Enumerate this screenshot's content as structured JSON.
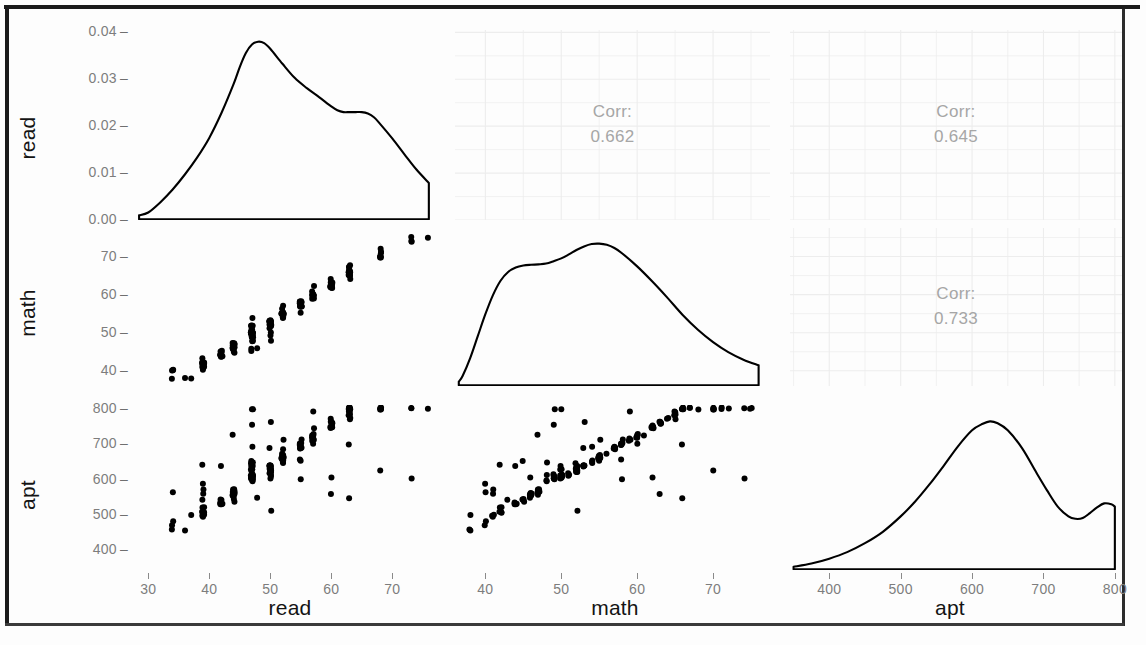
{
  "figure": {
    "type": "scatterplot-matrix",
    "variables": [
      "read",
      "math",
      "apt"
    ],
    "diagonal": "density",
    "lower": "points",
    "upper": "correlation"
  },
  "labels": {
    "read": "read",
    "math": "math",
    "apt": "apt",
    "corr_prefix": "Corr:"
  },
  "axes": {
    "read_density_y": {
      "ticks": [
        "0.04",
        "0.03",
        "0.02",
        "0.01",
        "0.00"
      ],
      "values": [
        0.04,
        0.03,
        0.02,
        0.01,
        0.0
      ]
    },
    "math_y": {
      "ticks": [
        "70",
        "60",
        "50",
        "40"
      ],
      "values": [
        70,
        60,
        50,
        40
      ]
    },
    "apt_y": {
      "ticks": [
        "800",
        "700",
        "600",
        "500",
        "400"
      ],
      "values": [
        800,
        700,
        600,
        500,
        400
      ]
    },
    "read_x": {
      "ticks": [
        "30",
        "40",
        "50",
        "60",
        "70"
      ],
      "values": [
        30,
        40,
        50,
        60,
        70
      ]
    },
    "math_x": {
      "ticks": [
        "40",
        "50",
        "60",
        "70"
      ],
      "values": [
        40,
        50,
        60,
        70
      ]
    },
    "apt_x": {
      "ticks": [
        "400",
        "500",
        "600",
        "700",
        "800"
      ],
      "values": [
        400,
        500,
        600,
        700,
        800
      ]
    }
  },
  "correlations": [
    {
      "row": "read",
      "col": "math",
      "label": "Corr:",
      "value": "0.662"
    },
    {
      "row": "read",
      "col": "apt",
      "label": "Corr:",
      "value": "0.645"
    },
    {
      "row": "math",
      "col": "apt",
      "label": "Corr:",
      "value": "0.733"
    }
  ],
  "colors": {
    "point": "#000000",
    "density_line": "#000000",
    "grid": "#ededed",
    "tick_text": "#7d7d7d",
    "axis_title": "#141414",
    "corr_text": "#a6a6a6",
    "panel_bg": "#ffffff",
    "frame": "#1a1a1a"
  },
  "chart_data": {
    "type": "scatter",
    "title": "",
    "xlabel": "",
    "ylabel": "",
    "grid": true,
    "legend": "none",
    "ranges": {
      "read": [
        27.5,
        77.5
      ],
      "math": [
        36.0,
        77.5
      ],
      "apt": [
        345,
        810
      ],
      "read_density": [
        0.0,
        0.0405
      ]
    },
    "densities": {
      "read": {
        "xlabel": "read",
        "ylabel": "density",
        "x": [
          28.5,
          30,
          32,
          34,
          36,
          38,
          40,
          42,
          44,
          45,
          46,
          47,
          48,
          49,
          50,
          52,
          54,
          56,
          58,
          60,
          61,
          62,
          63,
          64,
          65,
          66,
          67,
          68,
          70,
          72,
          74,
          76
        ],
        "y": [
          0.001,
          0.0016,
          0.0038,
          0.0065,
          0.0097,
          0.0133,
          0.0175,
          0.0228,
          0.029,
          0.0326,
          0.0356,
          0.0374,
          0.038,
          0.0377,
          0.0365,
          0.0333,
          0.0303,
          0.0281,
          0.0262,
          0.0242,
          0.0234,
          0.023,
          0.023,
          0.023,
          0.023,
          0.0227,
          0.0219,
          0.0205,
          0.0174,
          0.014,
          0.0107,
          0.0079
        ]
      },
      "math": {
        "xlabel": "math",
        "ylabel": "density",
        "x": [
          36.5,
          37,
          38,
          39,
          40,
          41,
          42,
          43,
          44,
          45,
          46,
          47,
          48,
          49,
          50,
          51,
          52,
          53,
          54,
          55,
          56,
          57,
          58,
          60,
          62,
          64,
          66,
          68,
          70,
          72,
          74,
          76
        ],
        "y": [
          0.0011,
          0.0025,
          0.007,
          0.0125,
          0.018,
          0.0228,
          0.0264,
          0.0286,
          0.0297,
          0.0302,
          0.0304,
          0.0305,
          0.0307,
          0.0313,
          0.032,
          0.033,
          0.0341,
          0.035,
          0.0356,
          0.0357,
          0.0354,
          0.0346,
          0.0333,
          0.03,
          0.0262,
          0.0221,
          0.0178,
          0.0141,
          0.011,
          0.0085,
          0.0066,
          0.0052
        ]
      },
      "apt": {
        "xlabel": "apt",
        "ylabel": "density",
        "x": [
          350,
          375,
          400,
          425,
          450,
          475,
          500,
          520,
          540,
          560,
          580,
          600,
          615,
          625,
          635,
          650,
          670,
          690,
          705,
          720,
          735,
          745,
          755,
          765,
          775,
          785,
          795,
          800
        ],
        "y": [
          0.0004,
          0.0008,
          0.0014,
          0.0022,
          0.0033,
          0.0047,
          0.0066,
          0.0084,
          0.0105,
          0.0128,
          0.0152,
          0.0172,
          0.018,
          0.0183,
          0.0181,
          0.0172,
          0.015,
          0.012,
          0.0098,
          0.0078,
          0.0066,
          0.0063,
          0.0064,
          0.007,
          0.0077,
          0.0082,
          0.0081,
          0.0078
        ]
      }
    },
    "scatter_panels": [
      {
        "x": "read",
        "y": "math",
        "corr": 0.662,
        "n": 200
      },
      {
        "x": "read",
        "y": "apt",
        "corr": 0.645,
        "n": 200
      },
      {
        "x": "math",
        "y": "apt",
        "corr": 0.733,
        "n": 200
      }
    ],
    "points": {
      "read": [
        34,
        39,
        63,
        44,
        47,
        47,
        57,
        39,
        48,
        47,
        34,
        37,
        47,
        47,
        39,
        47,
        47,
        50,
        47,
        34,
        50,
        52,
        55,
        39,
        57,
        63,
        55,
        60,
        47,
        63,
        44,
        50,
        55,
        52,
        57,
        47,
        39,
        52,
        47,
        44,
        50,
        47,
        68,
        55,
        60,
        50,
        50,
        68,
        44,
        52,
        60,
        50,
        42,
        44,
        50,
        47,
        63,
        44,
        57,
        47,
        39,
        42,
        55,
        47,
        47,
        60,
        50,
        52,
        63,
        73,
        63,
        55,
        47,
        44,
        50,
        63,
        47,
        55,
        52,
        57,
        42,
        44,
        76,
        68,
        47,
        60,
        52,
        39,
        50,
        52,
        55,
        44,
        63,
        47,
        60,
        50,
        57,
        36,
        47,
        52,
        60,
        44,
        52,
        47,
        42,
        39,
        55,
        63,
        34,
        50,
        52,
        60,
        47,
        68,
        57,
        44,
        47,
        63,
        50,
        55,
        39,
        52,
        47,
        60,
        44,
        73,
        57,
        50,
        42,
        47,
        55,
        63,
        68,
        47,
        52,
        60,
        44,
        50,
        57,
        39,
        47,
        55,
        50,
        63,
        42,
        52,
        68,
        47,
        60,
        44,
        50,
        55,
        47,
        39,
        63,
        52,
        57,
        50,
        44,
        47,
        60,
        68,
        42,
        55,
        47,
        50,
        63,
        57,
        44,
        52,
        47,
        60,
        39,
        50,
        55,
        47,
        73,
        63,
        42,
        57,
        50,
        47,
        44,
        60,
        52,
        68,
        47,
        55,
        50,
        63,
        39,
        47,
        57,
        44,
        52,
        50,
        60,
        47,
        55,
        42,
        50,
        63
      ],
      "math": [
        40,
        41,
        65,
        45,
        50,
        45,
        62,
        40,
        46,
        48,
        40,
        38,
        46,
        52,
        43,
        54,
        52,
        48,
        50,
        38,
        52,
        57,
        58,
        42,
        60,
        66,
        57,
        63,
        49,
        67,
        45,
        52,
        55,
        54,
        61,
        50,
        42,
        55,
        50,
        47,
        53,
        51,
        72,
        57,
        64,
        52,
        49,
        71,
        46,
        54,
        62,
        50,
        44,
        47,
        53,
        51,
        68,
        46,
        60,
        48,
        42,
        45,
        58,
        50,
        52,
        63,
        51,
        56,
        66,
        75,
        65,
        57,
        48,
        46,
        52,
        64,
        50,
        58,
        55,
        60,
        44,
        47,
        75,
        70,
        49,
        63,
        55,
        41,
        52,
        55,
        58,
        46,
        66,
        50,
        62,
        53,
        59,
        38,
        49,
        55,
        63,
        46,
        54,
        49,
        44,
        41,
        58,
        67,
        40,
        52,
        55,
        62,
        50,
        70,
        60,
        47,
        50,
        65,
        53,
        57,
        42,
        55,
        49,
        63,
        46,
        74,
        59,
        52,
        44,
        50,
        58,
        66,
        71,
        49,
        55,
        62,
        46,
        53,
        60,
        41,
        50,
        57,
        52,
        65,
        44,
        55,
        70,
        49,
        62,
        47,
        52,
        58,
        50,
        42,
        66,
        54,
        59,
        53,
        47,
        50,
        63,
        70,
        45,
        57,
        49,
        52,
        65,
        60,
        47,
        55,
        50,
        62,
        41,
        53,
        58,
        49,
        74,
        66,
        44,
        59,
        52,
        50,
        47,
        63,
        55,
        70,
        49,
        58,
        53,
        66,
        42,
        50,
        60,
        46,
        55,
        52,
        62,
        49,
        57,
        45,
        53,
        66
      ],
      "apt": [
        563,
        563,
        770,
        540,
        606,
        650,
        742,
        585,
        550,
        650,
        480,
        500,
        608,
        648,
        540,
        694,
        640,
        614,
        627,
        460,
        632,
        684,
        713,
        521,
        700,
        800,
        690,
        760,
        615,
        800,
        545,
        620,
        650,
        645,
        726,
        606,
        520,
        655,
        614,
        570,
        636,
        612,
        800,
        690,
        770,
        625,
        600,
        800,
        560,
        652,
        745,
        608,
        530,
        568,
        640,
        616,
        800,
        556,
        717,
        595,
        508,
        545,
        700,
        612,
        624,
        760,
        616,
        670,
        800,
        800,
        788,
        688,
        600,
        558,
        634,
        772,
        607,
        700,
        662,
        723,
        533,
        568,
        800,
        800,
        612,
        760,
        664,
        497,
        627,
        661,
        700,
        556,
        800,
        611,
        748,
        638,
        710,
        455,
        604,
        663,
        757,
        558,
        650,
        605,
        530,
        498,
        700,
        800,
        470,
        628,
        662,
        750,
        610,
        800,
        720,
        570,
        605,
        790,
        640,
        690,
        508,
        660,
        610,
        760,
        556,
        800,
        712,
        624,
        534,
        608,
        700,
        800,
        800,
        603,
        660,
        748,
        556,
        636,
        730,
        500,
        614,
        690,
        628,
        780,
        533,
        665,
        800,
        604,
        750,
        566,
        630,
        700,
        610,
        507,
        800,
        652,
        713,
        640,
        568,
        612,
        760,
        800,
        543,
        690,
        600,
        628,
        782,
        728,
        558,
        715,
        630,
        608,
        572,
        762,
        655,
        800,
        604,
        700,
        641,
        790,
        512,
        640,
        723,
        560,
        667,
        626,
        752,
        600,
        690,
        545,
        644,
        800
      ]
    }
  }
}
